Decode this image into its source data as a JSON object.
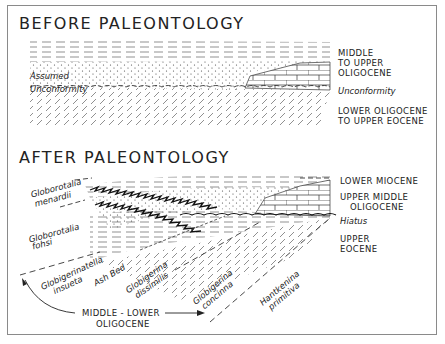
{
  "before": {
    "title": "BEFORE PALEONTOLOGY",
    "labels": {
      "middle_upper_1": "MIDDLE",
      "middle_upper_2": "TO UPPER",
      "middle_upper_3": "OLIGOCENE",
      "unconformity_right": "Unconformity",
      "lower_1": "LOWER OLIGOCENE",
      "lower_2": "TO UPPER EOCENE",
      "assumed": "Assumed",
      "unconformity_left": "Unconformity"
    }
  },
  "after": {
    "title": "AFTER PALEONTOLOGY",
    "labels": {
      "lower_miocene": "LOWER MIOCENE",
      "upper_middle_1": "UPPER MIDDLE",
      "upper_middle_2": "OLIGOCENE",
      "hiatus": "Hiatus",
      "upper_eocene_1": "UPPER",
      "upper_eocene_2": "EOCENE",
      "menardii_1": "Globorotalia",
      "menardii_2": "menardii",
      "fohsi_1": "Globorotalia",
      "fohsi_2": "fohsi",
      "insueta_1": "Globigerinatella",
      "insueta_2": "insueta",
      "ash_bed": "Ash Bed",
      "dissimilis_1": "Globigerina",
      "dissimilis_2": "dissimilis",
      "concinna_1": "Globigerina",
      "concinna_2": "concinna",
      "primitiva_1": "Hantkenina",
      "primitiva_2": "primitiva",
      "mid_lower_1": "MIDDLE - LOWER",
      "mid_lower_2": "OLIGOCENE"
    }
  }
}
